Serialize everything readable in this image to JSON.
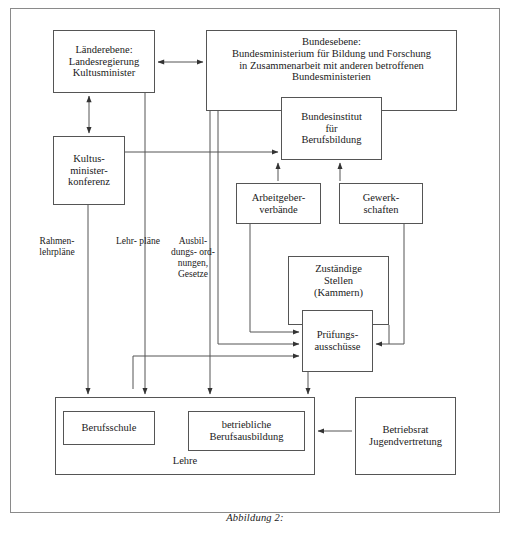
{
  "figure": {
    "caption": "Abbildung 2:"
  },
  "boxes": {
    "laenderebene": {
      "line1": "Länderebene:",
      "line2": "Landesregierung",
      "line3": "Kultusminister"
    },
    "bundesebene": {
      "line1": "Bundesebene:",
      "line2": "Bundesministerium für Bildung und Forschung",
      "line3": "in Zusammenarbeit mit anderen betroffenen",
      "line4": "Bundesministerien"
    },
    "bundesinstitut": {
      "line1": "Bundesinstitut",
      "line2": "für",
      "line3": "Berufsbildung"
    },
    "kmk": {
      "line1": "Kultus-",
      "line2": "minister-",
      "line3": "konferenz"
    },
    "arbeitgeber": {
      "line1": "Arbeitgeber-",
      "line2": "verbände"
    },
    "gewerkschaften": {
      "line1": "Gewerk-",
      "line2": "schaften"
    },
    "zustaendige": {
      "line1": "Zuständige",
      "line2": "Stellen",
      "line3": "(Kammern)"
    },
    "pruefung": {
      "line1": "Prüfungs-",
      "line2": "ausschüsse"
    },
    "lehre": {
      "label": "Lehre"
    },
    "berufsschule": {
      "label": "Berufsschule"
    },
    "betriebliche": {
      "line1": "betriebliche",
      "line2": "Berufsausbildung"
    },
    "betriebsrat": {
      "line1": "Betriebsrat",
      "line2": "Jugendvertretung"
    }
  },
  "flow_labels": {
    "rahmenlehrplaene": {
      "line1": "Rahmen-",
      "line2": "lehrpläne"
    },
    "lehrplaene": {
      "line1": "Lehr-",
      "line2": "pläne"
    },
    "ausbildungsordnungen": {
      "line1": "Ausbil-",
      "line2": "dungs-",
      "line3": "ord-",
      "line4": "nungen,",
      "line5": "Gesetze"
    }
  },
  "colors": {
    "line": "#555555",
    "outer_border": "#8a8a8a",
    "background": "#ffffff",
    "text": "#1a1a1a"
  },
  "diagram_meta": {
    "node_count": 12,
    "connector_count": 14
  }
}
